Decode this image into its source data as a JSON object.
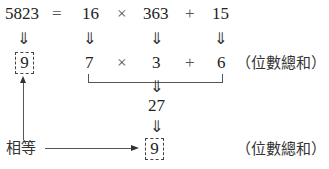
{
  "equation": {
    "dividend": "5823",
    "equals": "=",
    "divisor": "16",
    "times": "×",
    "quotient": "363",
    "plus": "+",
    "remainder": "15"
  },
  "down_arrow": "⇓",
  "digit_sums": {
    "dividend": "9",
    "divisor": "7",
    "times": "×",
    "quotient": "3",
    "plus": "+",
    "remainder": "6",
    "note": "（位數總和）"
  },
  "combined": {
    "value": "27",
    "digit_sum": "9",
    "note": "（位數總和）"
  },
  "equal_label": "相等"
}
